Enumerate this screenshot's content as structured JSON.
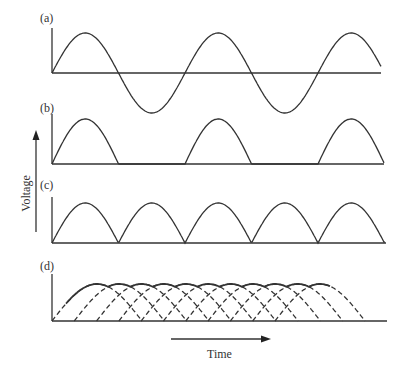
{
  "figure": {
    "panels": [
      {
        "id": "a",
        "label": "(a)",
        "description": "Full AC sine wave"
      },
      {
        "id": "b",
        "label": "(b)",
        "description": "Half-wave rectified"
      },
      {
        "id": "c",
        "label": "(c)",
        "description": "Full-wave rectified"
      },
      {
        "id": "d",
        "label": "(d)",
        "description": "Overlapping phase-shifted rectified pulses (multi-phase), dashed"
      }
    ],
    "y_axis_label": "Voltage",
    "x_axis_label": "Time",
    "colors": {
      "line": "#333333",
      "background": "#ffffff"
    }
  }
}
